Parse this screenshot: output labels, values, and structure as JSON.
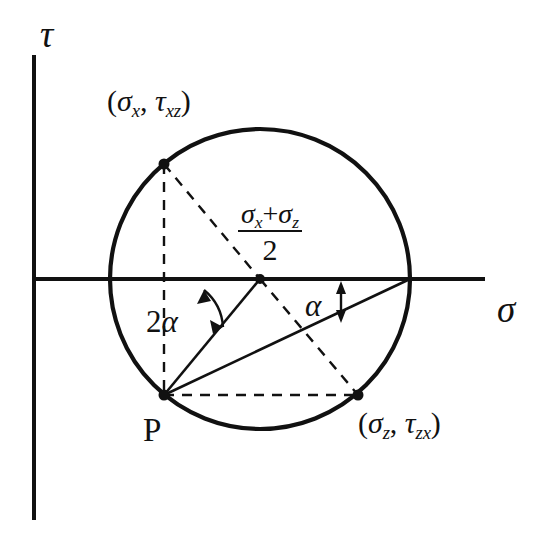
{
  "figure": {
    "background_color": "#ffffff",
    "stroke_color": "#111111"
  },
  "axes": {
    "vertical": {
      "label": "τ",
      "name": "tau-axis",
      "x": 34,
      "y_top": 55,
      "y_bottom": 520
    },
    "horizontal": {
      "label": "σ",
      "name": "sigma-axis",
      "y": 279,
      "x_left": 34,
      "x_right": 485
    }
  },
  "circle": {
    "center_x": 260,
    "center_y": 279,
    "radius": 150,
    "center_dot_label": "center"
  },
  "points": [
    {
      "name": "point-sigma-x-tau-xz",
      "x": 164,
      "y": 164,
      "label_open": "(",
      "label_main1": "σ",
      "label_sub1": "x",
      "label_comma": ", ",
      "label_main2": "τ",
      "label_sub2": "xz",
      "label_close": ")",
      "label_plain": "(σx, τxz)"
    },
    {
      "name": "point-p",
      "x": 164,
      "y": 395,
      "label_plain": "P"
    },
    {
      "name": "point-sigma-z-tau-zx",
      "x": 358,
      "y": 395,
      "label_open": "(",
      "label_main1": "σ",
      "label_sub1": "z",
      "label_comma": ", ",
      "label_main2": "τ",
      "label_sub2": "zx",
      "label_close": ")",
      "label_plain": "(σz, τzx)"
    }
  ],
  "center_fraction": {
    "name": "center-stress-fraction",
    "numerator_term1": "σ",
    "numerator_sub1": "x",
    "numerator_op": "+",
    "numerator_term2": "σ",
    "numerator_sub2": "z",
    "denominator": "2",
    "plain": "(σx + σz) / 2"
  },
  "angles": [
    {
      "name": "angle-two-alpha",
      "number": "2",
      "symbol": "α",
      "plain": "2α",
      "description": "angle at circle center between sigma axis and line to P"
    },
    {
      "name": "angle-alpha",
      "number": "",
      "symbol": "α",
      "plain": "α",
      "description": "angle at pole P between sigma axis direction and pole line"
    }
  ],
  "lines": {
    "dashed": [
      {
        "name": "dashed-ax-to-p",
        "x1": 164,
        "y1": 164,
        "x2": 164,
        "y2": 395
      },
      {
        "name": "dashed-ax-to-center",
        "x1": 164,
        "y1": 164,
        "x2": 260,
        "y2": 279
      },
      {
        "name": "dashed-center-to-bz",
        "x1": 260,
        "y1": 279,
        "x2": 358,
        "y2": 395
      },
      {
        "name": "dashed-p-to-bz",
        "x1": 164,
        "y1": 395,
        "x2": 358,
        "y2": 395
      }
    ],
    "solid": [
      {
        "name": "solid-p-to-center",
        "x1": 164,
        "y1": 395,
        "x2": 260,
        "y2": 279
      },
      {
        "name": "solid-p-to-right-intersection",
        "x1": 164,
        "y1": 395,
        "x2": 410,
        "y2": 279
      }
    ]
  }
}
